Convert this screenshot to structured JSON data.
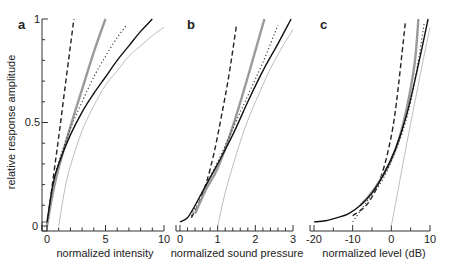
{
  "figure": {
    "ylabel": "relative response amplitude",
    "ytick_labels": [
      "0",
      "0.5",
      "1"
    ]
  },
  "chart_data": [
    {
      "panel": "a",
      "type": "line",
      "xlabel": "normalized intensity",
      "ylabel": "relative response amplitude",
      "xlim": [
        0,
        10
      ],
      "ylim": [
        0,
        1
      ],
      "xticks": [
        0,
        5,
        10
      ],
      "yticks": [
        0,
        0.5,
        1
      ],
      "grid": false,
      "series": [
        {
          "name": "dashed",
          "style": "dashed",
          "x": [
            0,
            0.5,
            1,
            1.5,
            2,
            2.3
          ],
          "y": [
            0,
            0.22,
            0.43,
            0.65,
            0.87,
            1.0
          ]
        },
        {
          "name": "thick gray",
          "style": "thick-gray",
          "x": [
            0,
            0.5,
            1,
            2,
            3,
            4,
            5
          ],
          "y": [
            0,
            0.16,
            0.28,
            0.48,
            0.66,
            0.84,
            1.0
          ]
        },
        {
          "name": "dotted",
          "style": "dotted",
          "x": [
            0,
            0.5,
            1,
            2,
            3,
            4,
            5,
            6,
            6.8
          ],
          "y": [
            0,
            0.2,
            0.31,
            0.47,
            0.6,
            0.72,
            0.82,
            0.91,
            0.97
          ]
        },
        {
          "name": "solid black",
          "style": "solid",
          "x": [
            0,
            0.5,
            1,
            2,
            3,
            4,
            5,
            6,
            7,
            8,
            9
          ],
          "y": [
            0.02,
            0.2,
            0.3,
            0.44,
            0.55,
            0.64,
            0.72,
            0.8,
            0.87,
            0.94,
            1.0
          ]
        },
        {
          "name": "light gray",
          "style": "thin-gray",
          "x": [
            1,
            1.5,
            2,
            3,
            4,
            5,
            6,
            7,
            8,
            9,
            10
          ],
          "y": [
            0,
            0.17,
            0.29,
            0.46,
            0.58,
            0.68,
            0.75,
            0.82,
            0.87,
            0.92,
            0.96
          ]
        }
      ]
    },
    {
      "panel": "b",
      "type": "line",
      "xlabel": "normalized sound pressure",
      "xlim": [
        0,
        3
      ],
      "ylim": [
        0,
        1
      ],
      "xticks": [
        0,
        1,
        2,
        3
      ],
      "grid": false,
      "series": [
        {
          "name": "dashed",
          "style": "dashed",
          "x": [
            0.3,
            0.5,
            0.7,
            0.9,
            1.1,
            1.3,
            1.5
          ],
          "y": [
            0.04,
            0.11,
            0.21,
            0.35,
            0.53,
            0.73,
            0.97
          ]
        },
        {
          "name": "thick gray",
          "style": "thick-gray",
          "x": [
            0.4,
            0.7,
            1.0,
            1.4,
            1.8,
            2.24
          ],
          "y": [
            0.06,
            0.18,
            0.28,
            0.48,
            0.72,
            1.0
          ]
        },
        {
          "name": "dotted",
          "style": "dotted",
          "x": [
            0.3,
            0.6,
            1.0,
            1.4,
            1.8,
            2.2,
            2.6
          ],
          "y": [
            0.05,
            0.17,
            0.31,
            0.47,
            0.63,
            0.79,
            0.97
          ]
        },
        {
          "name": "solid black",
          "style": "solid",
          "x": [
            0,
            0.2,
            0.4,
            0.7,
            1.0,
            1.4,
            1.8,
            2.2,
            2.6,
            2.95
          ],
          "y": [
            0.02,
            0.04,
            0.1,
            0.2,
            0.3,
            0.44,
            0.6,
            0.75,
            0.88,
            1.0
          ]
        },
        {
          "name": "light gray",
          "style": "thin-gray",
          "x": [
            1.0,
            1.2,
            1.5,
            1.8,
            2.1,
            2.4,
            2.7,
            3.0
          ],
          "y": [
            0,
            0.16,
            0.35,
            0.51,
            0.64,
            0.76,
            0.86,
            0.95
          ]
        }
      ]
    },
    {
      "panel": "c",
      "type": "line",
      "xlabel": "normalized level  (dB)",
      "xlim": [
        -20,
        10
      ],
      "ylim": [
        0,
        1
      ],
      "xticks": [
        -20,
        -10,
        0,
        10
      ],
      "grid": false,
      "series": [
        {
          "name": "dashed",
          "style": "dashed",
          "x": [
            -10,
            -7,
            -5,
            -3,
            -1,
            1,
            3.6
          ],
          "y": [
            0.05,
            0.09,
            0.14,
            0.22,
            0.35,
            0.55,
            0.98
          ]
        },
        {
          "name": "thick gray",
          "style": "thick-gray",
          "x": [
            -8,
            -6,
            -4,
            -2,
            0,
            2,
            4,
            6,
            7
          ],
          "y": [
            0.1,
            0.14,
            0.19,
            0.25,
            0.32,
            0.42,
            0.57,
            0.78,
            1.0
          ]
        },
        {
          "name": "dotted",
          "style": "dotted",
          "x": [
            -10,
            -7,
            -5,
            -3,
            -1,
            1,
            3,
            5,
            7,
            8.5
          ],
          "y": [
            0.02,
            0.1,
            0.15,
            0.2,
            0.27,
            0.36,
            0.46,
            0.6,
            0.8,
            0.98
          ]
        },
        {
          "name": "solid black",
          "style": "solid",
          "x": [
            -20,
            -17,
            -14,
            -11,
            -8,
            -5,
            -2,
            1,
            4,
            7,
            9.5
          ],
          "y": [
            0.02,
            0.025,
            0.04,
            0.06,
            0.1,
            0.16,
            0.25,
            0.37,
            0.54,
            0.78,
            1.0
          ]
        },
        {
          "name": "light gray",
          "style": "thin-gray",
          "x": [
            0,
            2,
            4,
            6,
            8,
            10
          ],
          "y": [
            0,
            0.2,
            0.4,
            0.59,
            0.78,
            0.96
          ]
        }
      ]
    }
  ],
  "panels": [
    {
      "letter": "a",
      "xlabel": "normalized intensity",
      "xtick_labels": [
        "0",
        "5",
        "10"
      ]
    },
    {
      "letter": "b",
      "xlabel": "normalized sound pressure",
      "xtick_labels": [
        "0",
        "1",
        "2",
        "3"
      ]
    },
    {
      "letter": "c",
      "xlabel": "normalized level  (dB)",
      "xtick_labels": [
        "-20",
        "-10",
        "0",
        "10"
      ]
    }
  ],
  "colors": {
    "axis": "#333333",
    "solid": "#111111",
    "dashed": "#222222",
    "dotted": "#333333",
    "thick_gray": "#9a9a9a",
    "thin_gray": "#b5b5b5"
  }
}
